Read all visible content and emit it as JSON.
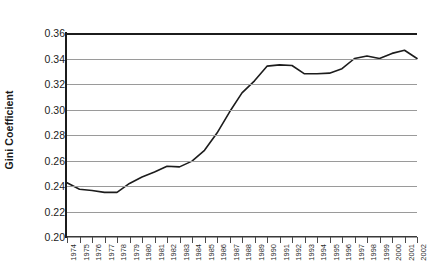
{
  "chart_data": {
    "type": "line",
    "title": "",
    "subtitle": "",
    "xlabel": "",
    "ylabel": "Gini Coefficient",
    "xlim": [
      1974,
      2002
    ],
    "ylim": [
      0.2,
      0.36
    ],
    "grid": true,
    "gridlines_y": [
      0.2,
      0.22,
      0.24,
      0.26,
      0.28,
      0.3,
      0.32,
      0.34,
      0.36
    ],
    "legend": false,
    "legend_position": "none",
    "line_color": "#1c1c1c",
    "series_name": "Gini Coefficient",
    "ytick_labels": [
      "0.36",
      "0.34",
      "0.32",
      "0.30",
      "0.28",
      "0.26",
      "0.24",
      "0.22",
      "0.20"
    ],
    "ytick_values": [
      0.36,
      0.34,
      0.32,
      0.3,
      0.28,
      0.26,
      0.24,
      0.22,
      0.2
    ],
    "categories": [
      "1974",
      "1975",
      "1976",
      "1977",
      "1978",
      "1979",
      "1980",
      "1981",
      "1982",
      "1983",
      "1984",
      "1985",
      "1986",
      "1987",
      "1988",
      "1989",
      "1990",
      "1991",
      "1992",
      "1993",
      "1994",
      "1995",
      "1996",
      "1997",
      "1998",
      "1999",
      "2000",
      "2001",
      "2002"
    ],
    "x": [
      1974,
      1975,
      1976,
      1977,
      1978,
      1979,
      1980,
      1981,
      1982,
      1983,
      1984,
      1985,
      1986,
      1987,
      1988,
      1989,
      1990,
      1991,
      1992,
      1993,
      1994,
      1995,
      1996,
      1997,
      1998,
      1999,
      2000,
      2001,
      2002
    ],
    "values": [
      0.2425,
      0.2375,
      0.2365,
      0.235,
      0.235,
      0.242,
      0.247,
      0.251,
      0.2555,
      0.255,
      0.2595,
      0.268,
      0.2815,
      0.298,
      0.313,
      0.3225,
      0.334,
      0.335,
      0.3345,
      0.328,
      0.328,
      0.3285,
      0.332,
      0.34,
      0.342,
      0.34,
      0.344,
      0.3465,
      0.34
    ],
    "annotations": []
  }
}
